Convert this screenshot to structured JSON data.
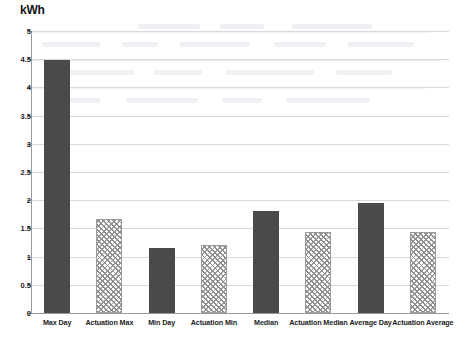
{
  "chart_data": {
    "type": "bar",
    "title": "",
    "subtitle": "",
    "xlabel": "",
    "ylabel": "kWh",
    "ylim": [
      0,
      5
    ],
    "ytick_step": 0.5,
    "yticks": [
      "0",
      "0.5",
      "1",
      "1.5",
      "2",
      "2.5",
      "3",
      "3.5",
      "4",
      "4.5",
      "5"
    ],
    "grid": true,
    "legend": "none",
    "categories": [
      "Max Day",
      "Actuation Max",
      "Min Day",
      "Actuation Min",
      "Median",
      "Actuation Median",
      "Average Day",
      "Actuation Average"
    ],
    "values": [
      4.48,
      1.67,
      1.15,
      1.21,
      1.8,
      1.43,
      1.95,
      1.44
    ],
    "bar_styles": [
      "solid",
      "hatch",
      "solid",
      "hatch",
      "solid",
      "hatch",
      "solid",
      "hatch"
    ],
    "colors": {
      "solid_bar": "#4a4a4a",
      "hatch_line": "#8e8e8e",
      "hatch_background": "#ffffff",
      "gridline": "#d9d9d9",
      "axis": "#9a9a9a",
      "text": "#1a1a1a",
      "plot_background": "#ffffff"
    }
  }
}
